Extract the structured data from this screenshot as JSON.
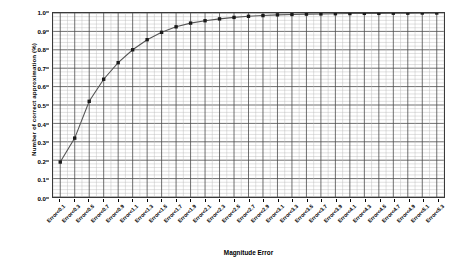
{
  "chart_data": {
    "type": "line",
    "title": "",
    "xlabel": "Magnitude Error",
    "ylabel": "Number of correct approximation (%)",
    "ylim": [
      0.0,
      1.0
    ],
    "ytick_labels": [
      "0.0",
      "0.1",
      "0.2",
      "0.3",
      "0.4",
      "0.5",
      "0.6",
      "0.7",
      "0.8",
      "0.9",
      "1.0"
    ],
    "ytick_values": [
      0.0,
      0.1,
      0.2,
      0.3,
      0.4,
      0.5,
      0.6,
      0.7,
      0.8,
      0.9,
      1.0
    ],
    "grid": true,
    "minor_grid": true,
    "legend": "none",
    "marker": "square",
    "line_color": "#555555",
    "marker_color": "#1a1a1a",
    "categories": [
      "Error<0.1",
      "Error<0.3",
      "Error<0.5",
      "Error<0.7",
      "Error<0.9",
      "Error<1.1",
      "Error<1.3",
      "Error<1.5",
      "Error<1.7",
      "Error<1.9",
      "Error<2.1",
      "Error<2.3",
      "Error<2.5",
      "Error<2.7",
      "Error<2.9",
      "Error<3.1",
      "Error<3.3",
      "Error<3.5",
      "Error<3.7",
      "Error<3.9",
      "Error<4.1",
      "Error<4.3",
      "Error<4.5",
      "Error<4.7",
      "Error<4.9",
      "Error<5.1",
      "Error<5.3"
    ],
    "values": [
      0.19,
      0.32,
      0.52,
      0.64,
      0.73,
      0.8,
      0.855,
      0.895,
      0.925,
      0.945,
      0.958,
      0.968,
      0.976,
      0.982,
      0.986,
      0.99,
      0.992,
      0.994,
      0.995,
      0.996,
      0.997,
      0.998,
      0.998,
      0.999,
      0.999,
      1.0,
      1.0
    ]
  }
}
